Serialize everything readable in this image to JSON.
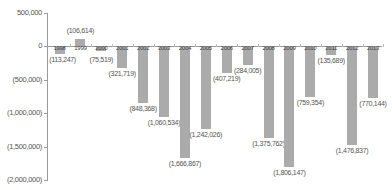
{
  "chart_data": {
    "type": "bar",
    "title": "",
    "xlabel": "",
    "ylabel": "",
    "ylim": [
      -2000000,
      500000
    ],
    "yticks": [
      "500,000",
      "0",
      "(500,000)",
      "(1,000,000)",
      "(1,500,000)",
      "(2,000,000)"
    ],
    "ytick_values": [
      500000,
      0,
      -500000,
      -1000000,
      -1500000,
      -2000000
    ],
    "grid": false,
    "legend": null,
    "categories": [
      "1998",
      "1999",
      "2000",
      "2001",
      "2002",
      "2003",
      "2004",
      "2005",
      "2006",
      "2007",
      "2008",
      "2009",
      "2010",
      "2011",
      "2012",
      "2013"
    ],
    "values": [
      -113247,
      106614,
      -75519,
      -321719,
      -848368,
      -1060534,
      -1666867,
      -1242026,
      -407219,
      -284005,
      -1375762,
      -1806147,
      -759354,
      -135689,
      -1476837,
      -770144
    ],
    "value_labels": [
      "(113,247)",
      "(106,614)",
      "(75,519)",
      "(321,719)",
      "(848,368)",
      "(1,060,534)",
      "(1,666,867)",
      "(1,242,026)",
      "(407,219)",
      "(284,005)",
      "(1,375,762)",
      "(1,806,147)",
      "(759,354)",
      "(135,689)",
      "(1,476,837)",
      "(770,144)"
    ],
    "bar_color": "#ababab"
  }
}
